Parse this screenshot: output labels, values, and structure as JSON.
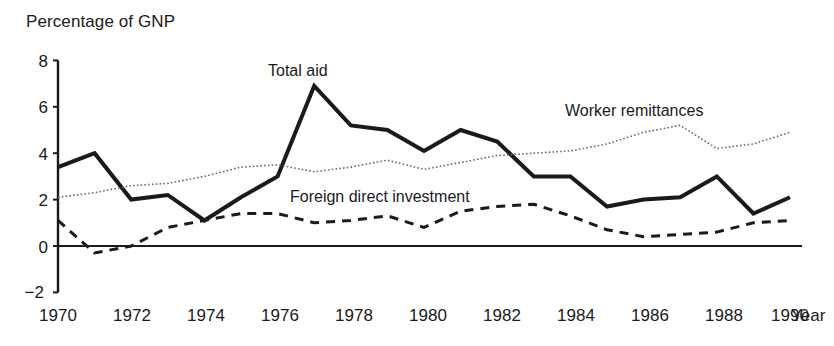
{
  "chart_data": {
    "type": "line",
    "title": "",
    "ylabel": "Percentage of GNP",
    "xlabel": "Year",
    "xlim": [
      1970,
      1990
    ],
    "ylim": [
      -2,
      8
    ],
    "yticks": [
      "8",
      "6",
      "4",
      "2",
      "0",
      "−2"
    ],
    "ytick_values": [
      8,
      6,
      4,
      2,
      0,
      -2
    ],
    "xticks": [
      "1970",
      "1972",
      "1974",
      "1976",
      "1978",
      "1980",
      "1982",
      "1984",
      "1986",
      "1988",
      "1990"
    ],
    "xtick_values": [
      1970,
      1972,
      1974,
      1976,
      1978,
      1980,
      1982,
      1984,
      1986,
      1988,
      1990
    ],
    "grid": false,
    "legend_position": "inline-annotations",
    "x": [
      1970,
      1971,
      1972,
      1973,
      1974,
      1975,
      1976,
      1977,
      1978,
      1979,
      1980,
      1981,
      1982,
      1983,
      1984,
      1985,
      1986,
      1987,
      1988,
      1989,
      1990
    ],
    "series": [
      {
        "name": "Total aid",
        "style": "solid-thick",
        "color": "#1a1a1a",
        "values": [
          3.4,
          4.0,
          2.0,
          2.2,
          1.1,
          2.1,
          3.0,
          6.9,
          5.2,
          5.0,
          4.1,
          5.0,
          4.5,
          3.0,
          3.0,
          1.7,
          2.0,
          2.1,
          3.0,
          1.4,
          2.1
        ]
      },
      {
        "name": "Worker remittances",
        "style": "dotted",
        "color": "#6b6b6b",
        "values": [
          2.1,
          2.3,
          2.6,
          2.7,
          3.0,
          3.4,
          3.5,
          3.2,
          3.4,
          3.7,
          3.3,
          3.6,
          3.9,
          4.0,
          4.1,
          4.4,
          4.9,
          5.2,
          4.2,
          4.4,
          4.9
        ]
      },
      {
        "name": "Foreign direct investment",
        "style": "dashed",
        "color": "#1a1a1a",
        "values": [
          1.1,
          -0.3,
          0.0,
          0.8,
          1.1,
          1.4,
          1.4,
          1.0,
          1.1,
          1.3,
          0.8,
          1.5,
          1.7,
          1.8,
          1.3,
          0.7,
          0.4,
          0.5,
          0.6,
          1.0,
          1.1
        ]
      }
    ],
    "annotations": [
      {
        "text": "Total aid",
        "x_px": 268,
        "y_px": 62
      },
      {
        "text": "Worker remittances",
        "x_px": 565,
        "y_px": 102
      },
      {
        "text": "Foreign direct investment",
        "x_px": 290,
        "y_px": 188
      }
    ]
  },
  "axes": {
    "y_title": "Percentage of GNP",
    "x_title": "Year"
  }
}
